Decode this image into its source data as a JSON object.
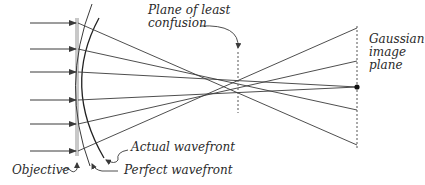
{
  "diagram": {
    "labels": {
      "plane_least_confusion": [
        "Plane of least",
        "confusion"
      ],
      "gaussian_plane": [
        "Gaussian",
        "image",
        "plane"
      ],
      "actual_wavefront": "Actual wavefront",
      "perfect_wavefront": "Perfect wavefront",
      "objective": "Objective"
    },
    "colors": {
      "ray": "#3a3a3a",
      "objective": "#c8c8c8",
      "plane": "#555555",
      "text": "#2a2a2a"
    },
    "incoming_rays_y": [
      23,
      49,
      72,
      100,
      124,
      151
    ],
    "gaussian_plane_x": 357,
    "least_confusion_x": 238,
    "focus_point": [
      357,
      87
    ]
  }
}
